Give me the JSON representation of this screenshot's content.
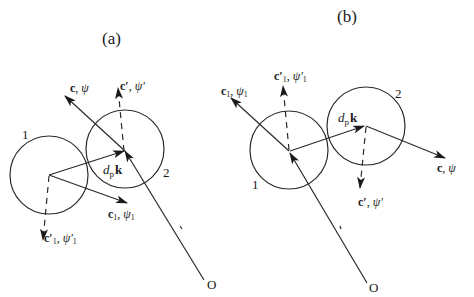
{
  "panels": [
    {
      "id": "a",
      "title": "(a)",
      "particle_1_label": "1",
      "particle_2_label": "2",
      "origin_label": "O",
      "vectors": {
        "c": {
          "name": "c",
          "sep": ",",
          "psi": "ψ"
        },
        "c_prime": {
          "name": "c′",
          "sep": ",",
          "psi": "ψ′"
        },
        "c1": {
          "name": "c",
          "sub": "1",
          "sep": ",",
          "psi": "ψ",
          "psi_sub": "1"
        },
        "c1_prime": {
          "name": "c′",
          "sub": "1",
          "sep": ",",
          "psi": "ψ′",
          "psi_sub": "1"
        },
        "dpk": {
          "d": "d",
          "sub": "p",
          "k": "k"
        }
      }
    },
    {
      "id": "b",
      "title": "(b)",
      "particle_1_label": "1",
      "particle_2_label": "2",
      "origin_label": "O",
      "vectors": {
        "c": {
          "name": "c",
          "sep": ",",
          "psi": "ψ"
        },
        "c_prime": {
          "name": "c′",
          "sep": ",",
          "psi": "ψ′"
        },
        "c1": {
          "name": "c",
          "sub": "1",
          "sep": ",",
          "psi": "ψ",
          "psi_sub": "1"
        },
        "c1_prime": {
          "name": "c′",
          "sub": "1",
          "sep": ",",
          "psi": "ψ′",
          "psi_sub": "1"
        },
        "dpk": {
          "d": "d",
          "sub": "p",
          "k": "k"
        }
      }
    }
  ],
  "colors": {
    "stroke": "#2a2a2a",
    "background": "#ffffff"
  }
}
